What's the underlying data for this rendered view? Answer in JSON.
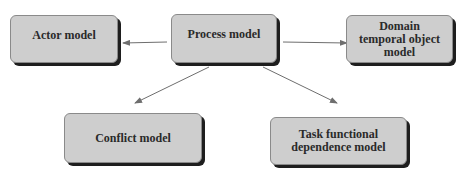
{
  "diagram": {
    "nodes": [
      {
        "id": "actor",
        "label": "Actor model"
      },
      {
        "id": "process",
        "label": "Process model"
      },
      {
        "id": "domain",
        "label": "Domain temporal object model"
      },
      {
        "id": "conflict",
        "label": "Conflict model"
      },
      {
        "id": "task",
        "label": "Task functional dependence model"
      }
    ],
    "edges": [
      {
        "from": "process",
        "to": "actor"
      },
      {
        "from": "process",
        "to": "domain"
      },
      {
        "from": "process",
        "to": "conflict"
      },
      {
        "from": "process",
        "to": "task"
      }
    ],
    "colors": {
      "box_fill": "#d6d6d6",
      "box_shadow": "#1e1e1e",
      "arrow": "#6e6e6e",
      "text": "#2a2a2a"
    }
  }
}
